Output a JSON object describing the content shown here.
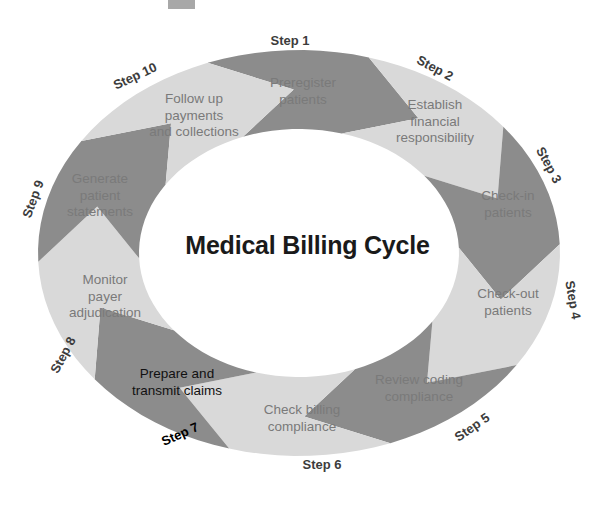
{
  "diagram": {
    "title": "Medical Billing Cycle",
    "type": "circular-cycle",
    "step_count": 10,
    "colors": {
      "dark_arrow": "#8c8c8c",
      "light_arrow": "#d9d9d9",
      "label_text": "#7a7a7a",
      "step_text": "#3c3c3c",
      "emphasis_text": "#000000",
      "background": "#ffffff",
      "top_mark": "#a8a8a8"
    },
    "top_mark_name": "gray-rectangle-mark",
    "steps": [
      {
        "step_label": "Step 1",
        "text": "Preregister\npatients",
        "tone": "dark",
        "emphasis": false,
        "label_x": 290,
        "label_y": 40,
        "label_rotate": 0,
        "text_x": 303,
        "text_y": 91
      },
      {
        "step_label": "Step 2",
        "text": "Establish\nfinancial\nresponsibility",
        "tone": "light",
        "emphasis": false,
        "label_x": 435,
        "label_y": 68,
        "label_rotate": 28,
        "text_x": 435,
        "text_y": 122
      },
      {
        "step_label": "Step 3",
        "text": "Check-in\npatients",
        "tone": "dark",
        "emphasis": false,
        "label_x": 549,
        "label_y": 165,
        "label_rotate": 62,
        "text_x": 508,
        "text_y": 204
      },
      {
        "step_label": "Step 4",
        "text": "Check-out\npatients",
        "tone": "light",
        "emphasis": false,
        "label_x": 573,
        "label_y": 300,
        "label_rotate": 80,
        "text_x": 508,
        "text_y": 302
      },
      {
        "step_label": "Step 5",
        "text": "Review coding\ncompliance",
        "tone": "dark",
        "emphasis": false,
        "label_x": 472,
        "label_y": 427,
        "label_rotate": -35,
        "text_x": 419,
        "text_y": 388
      },
      {
        "step_label": "Step 6",
        "text": "Check billing\ncompliance",
        "tone": "light",
        "emphasis": false,
        "label_x": 322,
        "label_y": 464,
        "label_rotate": 0,
        "text_x": 302,
        "text_y": 418
      },
      {
        "step_label": "Step 7",
        "text": "Prepare and\ntransmit claims",
        "tone": "dark",
        "emphasis": true,
        "label_x": 180,
        "label_y": 434,
        "label_rotate": -24,
        "text_x": 177,
        "text_y": 382
      },
      {
        "step_label": "Step 8",
        "text": "Monitor\npayer\nadjudication",
        "tone": "light",
        "emphasis": false,
        "label_x": 63,
        "label_y": 355,
        "label_rotate": -62,
        "text_x": 105,
        "text_y": 297
      },
      {
        "step_label": "Step 9",
        "text": "Generate\npatient\nstatements",
        "tone": "dark",
        "emphasis": false,
        "label_x": 33,
        "label_y": 199,
        "label_rotate": -70,
        "text_x": 100,
        "text_y": 196
      },
      {
        "step_label": "Step 10",
        "text": "Follow up\npayments\nand collections",
        "tone": "light",
        "emphasis": false,
        "label_x": 135,
        "label_y": 76,
        "label_rotate": -25,
        "text_x": 194,
        "text_y": 116
      }
    ]
  }
}
